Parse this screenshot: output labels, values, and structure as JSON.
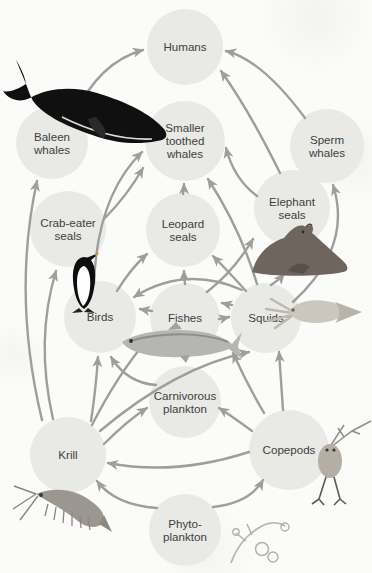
{
  "diagram": {
    "type": "food-web",
    "colors": {
      "node_fill": "#e9e9e6",
      "arrow": "#9e9e9b",
      "text": "#3e3e3e",
      "background": "#fbfbf9"
    },
    "nodes": [
      {
        "id": "humans",
        "label": [
          "Humans"
        ],
        "x": 185,
        "y": 47,
        "r": 38
      },
      {
        "id": "baleen-whales",
        "label": [
          "Baleen",
          "whales"
        ],
        "x": 52,
        "y": 143,
        "r": 36,
        "illustration": "baleen-whale"
      },
      {
        "id": "smaller-toothed-whales",
        "label": [
          "Smaller",
          "toothed",
          "whales"
        ],
        "x": 185,
        "y": 141,
        "r": 40
      },
      {
        "id": "sperm-whales",
        "label": [
          "Sperm",
          "whales"
        ],
        "x": 327,
        "y": 146,
        "r": 37
      },
      {
        "id": "crab-eater-seals",
        "label": [
          "Crab-eater",
          "seals"
        ],
        "x": 68,
        "y": 229,
        "r": 38
      },
      {
        "id": "leopard-seals",
        "label": [
          "Leopard",
          "seals"
        ],
        "x": 183,
        "y": 230,
        "r": 37
      },
      {
        "id": "elephant-seals",
        "label": [
          "Elephant",
          "seals"
        ],
        "x": 292,
        "y": 208,
        "r": 38,
        "illustration": "elephant-seal"
      },
      {
        "id": "birds",
        "label": [
          "Birds"
        ],
        "x": 100,
        "y": 317,
        "r": 36,
        "illustration": "penguin"
      },
      {
        "id": "fishes",
        "label": [
          "Fishes"
        ],
        "x": 185,
        "y": 318,
        "r": 35,
        "illustration": "fish"
      },
      {
        "id": "squids",
        "label": [
          "Squids"
        ],
        "x": 266,
        "y": 318,
        "r": 35,
        "illustration": "squid"
      },
      {
        "id": "carnivorous-plankton",
        "label": [
          "Carnivorous",
          "plankton"
        ],
        "x": 185,
        "y": 402,
        "r": 36
      },
      {
        "id": "krill",
        "label": [
          "Krill"
        ],
        "x": 68,
        "y": 455,
        "r": 38,
        "illustration": "krill"
      },
      {
        "id": "copepods",
        "label": [
          "Copepods"
        ],
        "x": 289,
        "y": 450,
        "r": 40,
        "illustration": "copepod"
      },
      {
        "id": "phytoplankton",
        "label": [
          "Phyto-",
          "plankton"
        ],
        "x": 185,
        "y": 530,
        "r": 36,
        "illustration": "phytoplankton"
      }
    ],
    "edges": [
      {
        "from": "phytoplankton",
        "to": "krill",
        "p": [
          157,
          508,
          115,
          505,
          97,
          481
        ]
      },
      {
        "from": "phytoplankton",
        "to": "copepods",
        "p": [
          213,
          507,
          250,
          503,
          263,
          480
        ]
      },
      {
        "from": "copepods",
        "to": "krill",
        "p": [
          249,
          452,
          175,
          476,
          108,
          463
        ]
      },
      {
        "from": "copepods",
        "to": "carnivorous-plankton",
        "p": [
          252,
          431,
          233,
          417,
          219,
          408
        ]
      },
      {
        "from": "copepods",
        "to": "fishes",
        "p": [
          264,
          413,
          247,
          384,
          233,
          353
        ]
      },
      {
        "from": "copepods",
        "to": "squids",
        "p": [
          283,
          410,
          281,
          382,
          279,
          352
        ]
      },
      {
        "from": "krill",
        "to": "carnivorous-plankton",
        "p": [
          104,
          444,
          128,
          420,
          147,
          408
        ]
      },
      {
        "from": "krill",
        "to": "fishes",
        "p": [
          92,
          425,
          118,
          374,
          148,
          339
        ]
      },
      {
        "from": "krill",
        "to": "squids",
        "p": [
          100,
          431,
          176,
          367,
          249,
          352
        ]
      },
      {
        "from": "krill",
        "to": "birds",
        "p": [
          91,
          421,
          96,
          388,
          98,
          357
        ]
      },
      {
        "from": "krill",
        "to": "baleen-whales",
        "p": [
          42,
          420,
          12,
          295,
          37,
          181
        ]
      },
      {
        "from": "krill",
        "to": "crab-eater-seals",
        "p": [
          53,
          419,
          35,
          340,
          56,
          271
        ]
      },
      {
        "from": "carnivorous-plankton",
        "to": "birds",
        "p": [
          156,
          385,
          127,
          383,
          111,
          357
        ]
      },
      {
        "from": "fishes",
        "to": "birds",
        "p": [
          152,
          311,
          145,
          310,
          140,
          309
        ]
      },
      {
        "from": "fishes",
        "to": "squids",
        "p": [
          219,
          319,
          225,
          318,
          229,
          317
        ]
      },
      {
        "from": "squids",
        "to": "fishes",
        "p": [
          232,
          305,
          226,
          304,
          222,
          303
        ]
      },
      {
        "from": "fishes",
        "to": "leopard-seals",
        "p": [
          185,
          284,
          184,
          277,
          184,
          271
        ]
      },
      {
        "from": "birds",
        "to": "leopard-seals",
        "p": [
          117,
          291,
          131,
          268,
          147,
          254
        ]
      },
      {
        "from": "squids",
        "to": "leopard-seals",
        "p": [
          246,
          291,
          227,
          270,
          213,
          256
        ]
      },
      {
        "from": "fishes",
        "to": "elephant-seals",
        "p": [
          207,
          292,
          234,
          271,
          253,
          239
        ]
      },
      {
        "from": "squids",
        "to": "elephant-seals",
        "p": [
          271,
          285,
          279,
          280,
          284,
          274
        ]
      },
      {
        "from": "squids",
        "to": "sperm-whales",
        "p": [
          293,
          302,
          353,
          247,
          333,
          185
        ]
      },
      {
        "from": "squids",
        "to": "smaller-toothed-whales",
        "p": [
          257,
          284,
          240,
          228,
          208,
          179
        ]
      },
      {
        "from": "elephant-seals",
        "to": "smaller-toothed-whales",
        "p": [
          257,
          196,
          234,
          179,
          226,
          148
        ]
      },
      {
        "from": "leopard-seals",
        "to": "smaller-toothed-whales",
        "p": [
          183,
          194,
          184,
          189,
          184,
          184
        ]
      },
      {
        "from": "birds",
        "to": "smaller-toothed-whales",
        "p": [
          94,
          284,
          97,
          196,
          142,
          152
        ]
      },
      {
        "from": "crab-eater-seals",
        "to": "smaller-toothed-whales",
        "p": [
          104,
          219,
          127,
          196,
          143,
          168
        ]
      },
      {
        "from": "baleen-whales",
        "to": "humans",
        "p": [
          74,
          116,
          99,
          62,
          143,
          50
        ]
      },
      {
        "from": "sperm-whales",
        "to": "humans",
        "p": [
          305,
          118,
          262,
          60,
          226,
          51
        ]
      },
      {
        "from": "elephant-seals",
        "to": "humans",
        "p": [
          280,
          173,
          249,
          110,
          221,
          71
        ]
      },
      {
        "from": "squids",
        "to": "birds",
        "p": [
          242,
          290,
          185,
          265,
          134,
          297
        ]
      }
    ]
  }
}
